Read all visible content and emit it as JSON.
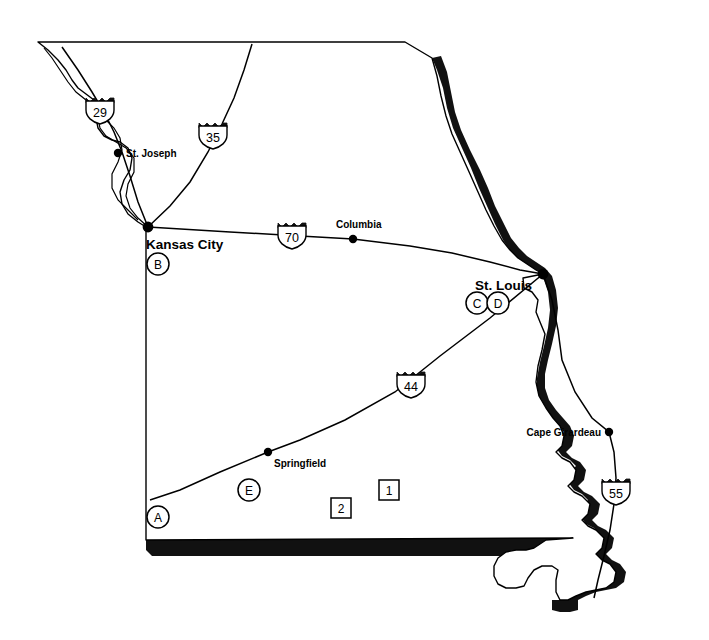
{
  "map": {
    "title": "Missouri",
    "background_color": "#ffffff",
    "outline_color": "#000000",
    "shadow_color": "#111111",
    "width": 709,
    "height": 640
  },
  "cities": [
    {
      "name": "St. Joseph",
      "dot_x": 118,
      "dot_y": 153,
      "label_x": 126,
      "label_y": 157,
      "anchor": "start",
      "style": "normal"
    },
    {
      "name": "Kansas City",
      "dot_x": 148,
      "dot_y": 227,
      "label_x": 146,
      "label_y": 249,
      "anchor": "start",
      "style": "major"
    },
    {
      "name": "Columbia",
      "dot_x": 353,
      "dot_y": 239,
      "label_x": 336,
      "label_y": 228,
      "anchor": "start",
      "style": "normal"
    },
    {
      "name": "St. Louis",
      "dot_x": 543,
      "dot_y": 274,
      "label_x": 532,
      "label_y": 290,
      "anchor": "end",
      "style": "major"
    },
    {
      "name": "Springfield",
      "dot_x": 268,
      "dot_y": 452,
      "label_x": 274,
      "label_y": 467,
      "anchor": "start",
      "style": "normal"
    },
    {
      "name": "Cape Girardeau",
      "dot_x": 609,
      "dot_y": 432,
      "label_x": 601,
      "label_y": 436,
      "anchor": "end",
      "style": "normal"
    }
  ],
  "shields": [
    {
      "route": "29",
      "x": 100,
      "y": 110
    },
    {
      "route": "35",
      "x": 213,
      "y": 135
    },
    {
      "route": "70",
      "x": 292,
      "y": 235
    },
    {
      "route": "44",
      "x": 411,
      "y": 384
    },
    {
      "route": "55",
      "x": 616,
      "y": 491
    }
  ],
  "circle_markers": [
    {
      "label": "A",
      "x": 158,
      "y": 517
    },
    {
      "label": "B",
      "x": 158,
      "y": 264
    },
    {
      "label": "C",
      "x": 477,
      "y": 303
    },
    {
      "label": "D",
      "x": 498,
      "y": 303
    },
    {
      "label": "E",
      "x": 249,
      "y": 490
    }
  ],
  "square_markers": [
    {
      "label": "1",
      "x": 389,
      "y": 490
    },
    {
      "label": "2",
      "x": 341,
      "y": 508
    }
  ]
}
